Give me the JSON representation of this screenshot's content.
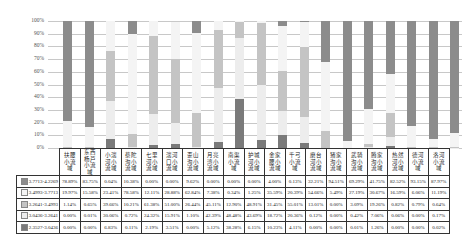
{
  "chart_data": {
    "type": "bar",
    "stacked": "percent",
    "title": "",
    "xlabel": "",
    "ylabel": "",
    "ylim": [
      0,
      100
    ],
    "yticks": [
      "0%",
      "10%",
      "20%",
      "30%",
      "40%",
      "50%",
      "60%",
      "70%",
      "80%",
      "90%",
      "100%"
    ],
    "grid": true,
    "legend_position": "table-left",
    "categories": [
      "扶腰小流域",
      "东西杨芦小流域",
      "小湍河小流域",
      "蔡陀沟小流域",
      "七里河小流域",
      "湍河口小流域",
      "歪山沟小流域",
      "月亮湾小流域",
      "南渠小流域",
      "护城河小流域",
      "金家腰小流域",
      "千弓小流域",
      "磨台河小流域",
      "猪家沟小流域",
      "武骑沟小流域",
      "腾家沟小流域",
      "热然河小流域",
      "德河小流域",
      "洛河小流域"
    ],
    "series": [
      {
        "name": "3.7713-4.2269",
        "color": "#8c8c8c",
        "values": [
          78.89,
          83.75,
          0.04,
          10.38,
          0.0,
          0.0,
          9.62,
          0.0,
          0.0,
          0.0,
          4.0,
          0.13,
          32.21,
          94.51,
          69.29,
          41.75,
          82.52,
          93.15,
          87.97
        ]
      },
      {
        "name": "3.4993-3.7713",
        "color": "#f4f4f4",
        "values": [
          19.97,
          15.58,
          23.41,
          78.58,
          12.11,
          28.88,
          62.84,
          7.38,
          0.34,
          1.25,
          35.59,
          20.39,
          54.66,
          5.49,
          27.19,
          30.67,
          16.59,
          6.06,
          11.19
        ]
      },
      {
        "name": "3.2641-3.4993",
        "color": "#c4c4c4",
        "values": [
          1.14,
          0.65,
          39.66,
          10.21,
          61.38,
          51.0,
          26.44,
          45.11,
          12.9,
          48.91,
          31.45,
          55.01,
          13.01,
          0.0,
          3.09,
          19.26,
          0.82,
          0.79,
          0.64
        ]
      },
      {
        "name": "3.0436-3.2641",
        "color": "#ededed",
        "values": [
          0.0,
          0.01,
          30.06,
          0.72,
          24.32,
          15.91,
          1.1,
          42.39,
          48.48,
          43.69,
          18.72,
          20.36,
          0.12,
          0.0,
          0.42,
          7.06,
          0.06,
          0.0,
          0.17
        ]
      },
      {
        "name": "2.3527-3.0436",
        "color": "#7a7a7a",
        "values": [
          0.0,
          0.0,
          6.83,
          0.11,
          2.19,
          3.51,
          0.0,
          5.12,
          38.28,
          6.15,
          10.23,
          4.11,
          0.0,
          0.0,
          0.01,
          1.26,
          0.0,
          0.0,
          0.02
        ]
      }
    ]
  },
  "table": {
    "rows_display": [
      [
        "78.89%",
        "83.75%",
        "0.04%",
        "10.38%",
        "0.00%",
        "0.00%",
        "9.62%",
        "0.00%",
        "0.00%",
        "0.00%",
        "4.00%",
        "0.13%",
        "32.21%",
        "94.51%",
        "69.29%",
        "41.75%",
        "82.52%",
        "93.15%",
        "87.97%"
      ],
      [
        "19.97%",
        "15.58%",
        "23.41%",
        "78.58%",
        "12.11%",
        "28.88%",
        "62.84%",
        "7.38%",
        "0.34%",
        "1.25%",
        "35.59%",
        "20.39%",
        "54.66%",
        "5.49%",
        "27.19%",
        "30.67%",
        "16.59%",
        "6.06%",
        "11.19%"
      ],
      [
        "1.14%",
        "0.65%",
        "39.66%",
        "10.21%",
        "61.38%",
        "51.00%",
        "26.44%",
        "45.11%",
        "12.90%",
        "48.91%",
        "31.45%",
        "55.01%",
        "13.01%",
        "0.00%",
        "3.09%",
        "19.26%",
        "0.82%",
        "0.79%",
        "0.64%"
      ],
      [
        "0.00%",
        "0.01%",
        "30.06%",
        "0.72%",
        "24.32%",
        "15.91%",
        "1.10%",
        "42.39%",
        "48.48%",
        "43.69%",
        "18.72%",
        "20.36%",
        "0.12%",
        "0.00%",
        "0.42%",
        "7.06%",
        "0.06%",
        "0.00%",
        "0.17%"
      ],
      [
        "0.00%",
        "0.00%",
        "6.83%",
        "0.11%",
        "2.19%",
        "3.51%",
        "0.00%",
        "5.12%",
        "38.28%",
        "6.15%",
        "10.23%",
        "4.11%",
        "0.00%",
        "0.00%",
        "0.01%",
        "1.26%",
        "0.00%",
        "0.00%",
        "0.02%"
      ]
    ]
  }
}
